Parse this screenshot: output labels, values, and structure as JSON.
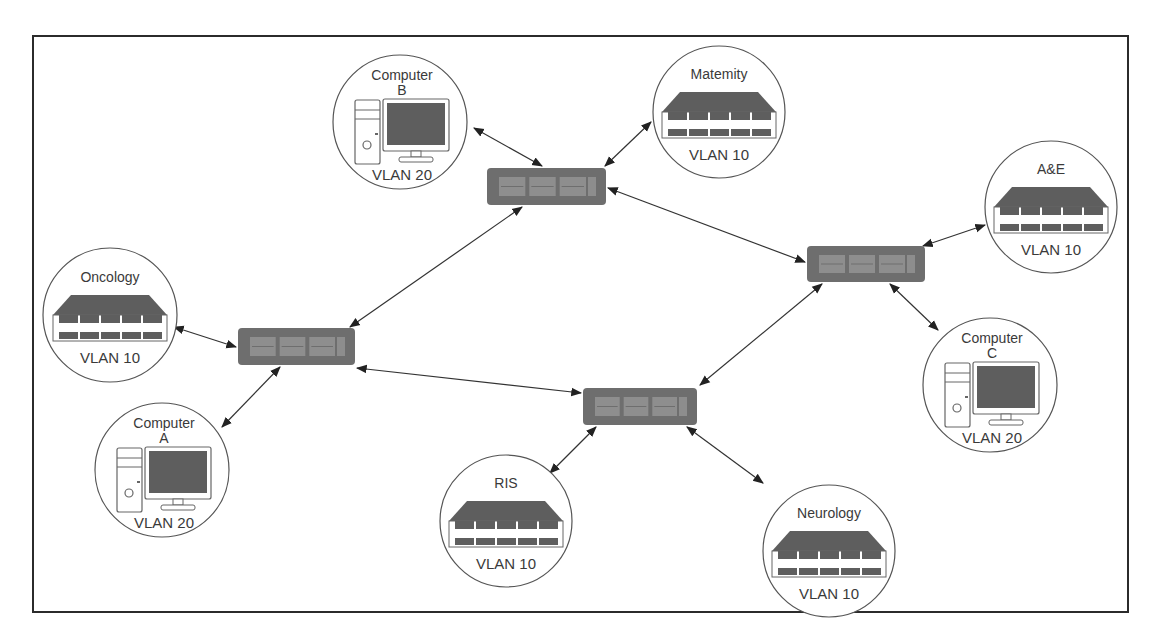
{
  "diagram": {
    "title": "",
    "colors": {
      "frame": "#2b2b2b",
      "line": "#333333",
      "switch_body": "#6e6e6e",
      "switch_panel": "#9a9a9a",
      "icon_fill": "#5e5e5e",
      "text": "#3a3a3a"
    },
    "switches": [
      {
        "id": "sw-top",
        "x": 487,
        "y": 168,
        "w": 119,
        "h": 37
      },
      {
        "id": "sw-left",
        "x": 238,
        "y": 328,
        "w": 117,
        "h": 37
      },
      {
        "id": "sw-right",
        "x": 807,
        "y": 246,
        "w": 118,
        "h": 36
      },
      {
        "id": "sw-bottom",
        "x": 583,
        "y": 388,
        "w": 114,
        "h": 37
      }
    ],
    "nodes": [
      {
        "id": "computer-b",
        "type": "computer",
        "line1": "Computer",
        "line2": "B",
        "vlan": "VLAN 20",
        "cx": 400,
        "cy": 122,
        "r": 67
      },
      {
        "id": "maternity",
        "type": "server",
        "line1": "Matemity",
        "line2": "",
        "vlan": "VLAN 10",
        "cx": 719,
        "cy": 112,
        "r": 66
      },
      {
        "id": "ae",
        "type": "server",
        "line1": "A&E",
        "line2": "",
        "vlan": "VLAN 10",
        "cx": 1051,
        "cy": 207,
        "r": 66
      },
      {
        "id": "oncology",
        "type": "server",
        "line1": "Oncology",
        "line2": "",
        "vlan": "VLAN 10",
        "cx": 110,
        "cy": 315,
        "r": 67
      },
      {
        "id": "computer-a",
        "type": "computer",
        "line1": "Computer",
        "line2": "A",
        "vlan": "VLAN 20",
        "cx": 162,
        "cy": 470,
        "r": 67
      },
      {
        "id": "computer-c",
        "type": "computer",
        "line1": "Computer",
        "line2": "C",
        "vlan": "VLAN 20",
        "cx": 990,
        "cy": 385,
        "r": 67
      },
      {
        "id": "ris",
        "type": "server",
        "line1": "RIS",
        "line2": "",
        "vlan": "VLAN 10",
        "cx": 506,
        "cy": 521,
        "r": 66
      },
      {
        "id": "neurology",
        "type": "server",
        "line1": "Neurology",
        "line2": "",
        "vlan": "VLAN 10",
        "cx": 829,
        "cy": 551,
        "r": 66
      }
    ],
    "links": [
      {
        "from": "computer-b",
        "to": "sw-top",
        "x1": 474,
        "y1": 128,
        "x2": 542,
        "y2": 166
      },
      {
        "from": "maternity",
        "to": "sw-top",
        "x1": 651,
        "y1": 122,
        "x2": 605,
        "y2": 166
      },
      {
        "from": "sw-top",
        "to": "sw-left",
        "x1": 522,
        "y1": 207,
        "x2": 350,
        "y2": 327
      },
      {
        "from": "sw-top",
        "to": "sw-right",
        "x1": 608,
        "y1": 188,
        "x2": 805,
        "y2": 262
      },
      {
        "from": "ae",
        "to": "sw-right",
        "x1": 985,
        "y1": 225,
        "x2": 923,
        "y2": 246
      },
      {
        "from": "oncology",
        "to": "sw-left",
        "x1": 174,
        "y1": 327,
        "x2": 236,
        "y2": 347
      },
      {
        "from": "computer-a",
        "to": "sw-left",
        "x1": 222,
        "y1": 427,
        "x2": 280,
        "y2": 367
      },
      {
        "from": "sw-left",
        "to": "sw-bottom",
        "x1": 357,
        "y1": 368,
        "x2": 581,
        "y2": 393
      },
      {
        "from": "sw-right",
        "to": "sw-bottom",
        "x1": 822,
        "y1": 284,
        "x2": 700,
        "y2": 385
      },
      {
        "from": "sw-right",
        "to": "computer-c",
        "x1": 890,
        "y1": 284,
        "x2": 938,
        "y2": 330
      },
      {
        "from": "sw-bottom",
        "to": "ris",
        "x1": 596,
        "y1": 427,
        "x2": 550,
        "y2": 473
      },
      {
        "from": "sw-bottom",
        "to": "neurology",
        "x1": 687,
        "y1": 427,
        "x2": 763,
        "y2": 483
      }
    ]
  }
}
